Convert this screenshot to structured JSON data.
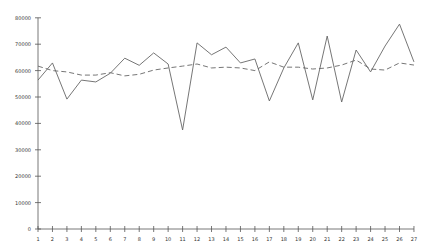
{
  "chart_data": {
    "type": "line",
    "title": "",
    "xlabel": "",
    "ylabel": "",
    "x": [
      1,
      2,
      3,
      4,
      5,
      6,
      7,
      8,
      9,
      10,
      11,
      12,
      13,
      14,
      15,
      16,
      17,
      18,
      19,
      20,
      21,
      22,
      23,
      24,
      25,
      26,
      27
    ],
    "ylim": [
      0,
      80000
    ],
    "yticks": [
      0,
      10000,
      20000,
      30000,
      40000,
      50000,
      60000,
      70000,
      80000
    ],
    "grid": false,
    "legend": null,
    "series": [
      {
        "name": "actual",
        "style": "solid",
        "color": "#666666",
        "values": [
          56400,
          62900,
          49200,
          56400,
          55700,
          59000,
          64700,
          62000,
          66700,
          62500,
          37500,
          70500,
          66000,
          68900,
          62900,
          64400,
          48500,
          61000,
          70500,
          48900,
          73100,
          48100,
          67800,
          59500,
          69300,
          77600,
          63300
        ]
      },
      {
        "name": "trend",
        "style": "dashed",
        "color": "#666666",
        "values": [
          61700,
          60000,
          59500,
          58300,
          58300,
          59200,
          58000,
          58600,
          60200,
          61000,
          61700,
          62500,
          61000,
          61300,
          61000,
          60000,
          63300,
          61300,
          61300,
          60600,
          61000,
          62100,
          64000,
          60600,
          60200,
          62900,
          62100
        ]
      }
    ]
  },
  "axis": {
    "x0_px": 38,
    "x_step_px": 14.46,
    "y0_px": 229,
    "y_per_10000_px": 26.4
  }
}
